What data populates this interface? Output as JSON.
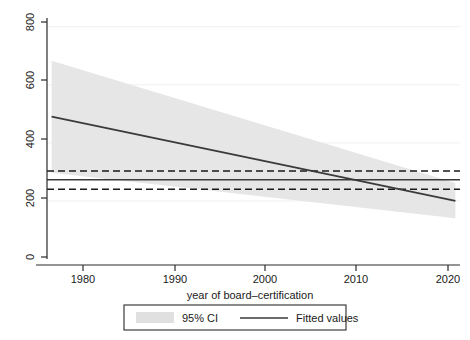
{
  "chart_data": {
    "type": "line",
    "title": "",
    "subtitle": "",
    "xlabel": "year of board–certification",
    "ylabel": "",
    "xlim": [
      1975.5,
      2020.5
    ],
    "ylim": [
      0,
      830
    ],
    "grid": true,
    "grid_orientation": "horizontal",
    "legend_position": "bottom-center",
    "x_ticks": [
      1980,
      1990,
      2000,
      2010,
      2020
    ],
    "x_tick_labels": [
      "1980",
      "1990",
      "2000",
      "2010",
      "2020"
    ],
    "y_ticks": [
      0,
      200,
      400,
      600,
      800
    ],
    "y_tick_labels": [
      "0",
      "200",
      "400",
      "600",
      "800"
    ],
    "series": [
      {
        "name": "Fitted values",
        "type": "line",
        "color": "#3a3a3a",
        "style": "solid",
        "x": [
          1976,
          2020
        ],
        "values": [
          490,
          200
        ]
      },
      {
        "name": "95% CI",
        "type": "band",
        "color": "#e6e6e6",
        "x": [
          1976,
          2020
        ],
        "upper": [
          683,
          262
        ],
        "lower": [
          297,
          140
        ]
      },
      {
        "name": "reference-mean",
        "type": "hline",
        "color": "#3a3a3a",
        "style": "solid",
        "value": 273
      },
      {
        "name": "reference-upper",
        "type": "hline",
        "color": "#1a1a1a",
        "style": "dashed",
        "value": 303
      },
      {
        "name": "reference-lower",
        "type": "hline",
        "color": "#1a1a1a",
        "style": "dashed",
        "value": 240
      }
    ],
    "legend": [
      {
        "label": "95% CI",
        "marker": "swatch",
        "color": "#e0e0e0"
      },
      {
        "label": "Fitted values",
        "marker": "line",
        "color": "#3a3a3a"
      }
    ]
  },
  "figure": {
    "background_color": "#ffffff",
    "axis_color": "#2b2b2b",
    "grid_color": "#f0f0f0"
  }
}
